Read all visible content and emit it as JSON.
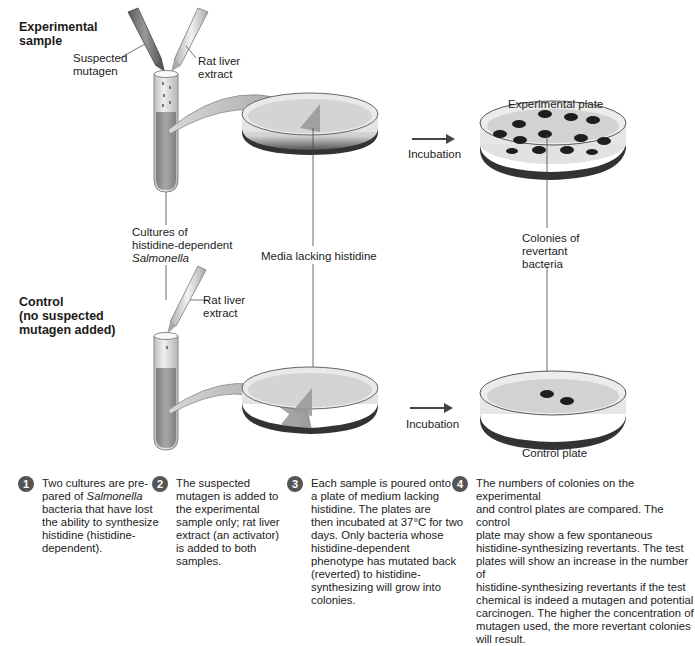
{
  "experimental": {
    "title_line1": "Experimental",
    "title_line2": "sample",
    "mutagen_label_line1": "Suspected",
    "mutagen_label_line2": "mutagen",
    "liver_label_line1": "Rat liver",
    "liver_label_line2": "extract",
    "plate_label": "Experimental plate",
    "incubation_label": "Incubation",
    "colony_count": 13
  },
  "shared": {
    "cultures_line1": "Cultures of",
    "cultures_line2": "histidine-dependent",
    "cultures_line3": "Salmonella",
    "media_label": "Media lacking histidine",
    "colonies_line1": "Colonies of",
    "colonies_line2": "revertant",
    "colonies_line3": "bacteria"
  },
  "control": {
    "title_line1": "Control",
    "title_line2": "(no suspected",
    "title_line3": "mutagen added)",
    "liver_label_line1": "Rat liver",
    "liver_label_line2": "extract",
    "plate_label": "Control plate",
    "incubation_label": "Incubation",
    "colony_count": 2
  },
  "steps": [
    {
      "number": "1",
      "lines": [
        "Two cultures are pre-",
        "pared of ",
        "Salmonella",
        "bacteria that have lost",
        "the ability to synthesize",
        "histidine (histidine-",
        "dependent)."
      ]
    },
    {
      "number": "2",
      "lines": [
        "The suspected",
        "mutagen is added to",
        "the experimental",
        "sample only; rat liver",
        "extract (an activator)",
        "is added to both",
        "samples."
      ]
    },
    {
      "number": "3",
      "lines": [
        "Each sample is poured onto",
        "a plate of medium lacking",
        "histidine. The plates are",
        "then incubated at 37°C for two",
        "days. Only bacteria whose",
        "histidine-dependent",
        "phenotype has mutated back",
        "(reverted) to histidine-",
        "synthesizing will grow into",
        "colonies."
      ]
    },
    {
      "number": "4",
      "lines": [
        "The numbers of colonies on the experimental",
        "and control plates are compared. The control",
        "plate may show a few spontaneous",
        "histidine-synthesizing revertants. The test",
        "plates will show an increase in the number of",
        "histidine-synthesizing revertants if the test",
        "chemical is indeed a mutagen and potential",
        "carcinogen. The higher the concentration of",
        "mutagen used, the more revertant colonies",
        "will result."
      ]
    }
  ],
  "colors": {
    "liquid": "#9a9a9a",
    "colony": "#1e1e1e",
    "badge": "#555555",
    "arrow": "#444444"
  }
}
